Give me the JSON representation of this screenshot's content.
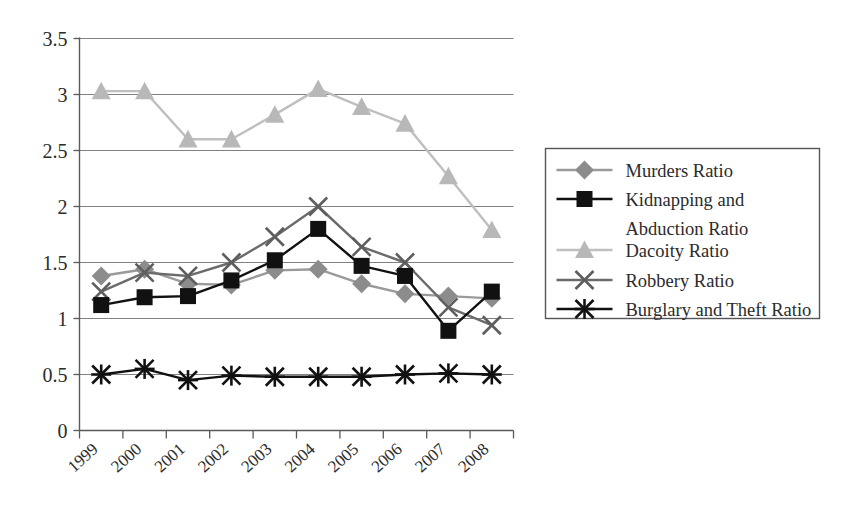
{
  "chart_data": {
    "type": "line",
    "title": "",
    "subtitle": "",
    "xlabel": "",
    "ylabel": "",
    "categories": [
      "1999",
      "2000",
      "2001",
      "2002",
      "2003",
      "2004",
      "2005",
      "2006",
      "2007",
      "2008"
    ],
    "ylim": [
      0,
      3.5
    ],
    "yticks": [
      "0",
      "0.5",
      "1",
      "1.5",
      "2",
      "2.5",
      "3",
      "3.5"
    ],
    "ytick_values": [
      0,
      0.5,
      1,
      1.5,
      2,
      2.5,
      3,
      3.5
    ],
    "grid": true,
    "grid_axis": "y",
    "legend_position": "right",
    "series": [
      {
        "name": "Murders Ratio",
        "marker": "diamond",
        "color": "#8c8c8c",
        "line_color": "#9a9a9a",
        "values": [
          1.38,
          1.44,
          1.31,
          1.3,
          1.43,
          1.44,
          1.31,
          1.22,
          1.2,
          1.18
        ]
      },
      {
        "name": "Kidnapping and Abduction Ratio",
        "marker": "square",
        "color": "#111111",
        "line_color": "#111111",
        "values": [
          1.12,
          1.19,
          1.2,
          1.34,
          1.52,
          1.8,
          1.47,
          1.38,
          0.89,
          1.24
        ]
      },
      {
        "name": "Dacoity Ratio",
        "marker": "triangle",
        "color": "#b8b8b8",
        "line_color": "#bfbfbf",
        "values": [
          3.03,
          3.03,
          2.6,
          2.6,
          2.82,
          3.05,
          2.89,
          2.74,
          2.27,
          1.79
        ]
      },
      {
        "name": "Robbery Ratio",
        "marker": "x",
        "color": "#5e5e5e",
        "line_color": "#6b6b6b",
        "values": [
          1.24,
          1.41,
          1.38,
          1.5,
          1.73,
          2.0,
          1.64,
          1.5,
          1.1,
          0.94
        ]
      },
      {
        "name": "Burglary and Theft Ratio",
        "marker": "asterisk",
        "color": "#111111",
        "line_color": "#111111",
        "values": [
          0.5,
          0.55,
          0.45,
          0.49,
          0.48,
          0.48,
          0.48,
          0.5,
          0.51,
          0.5
        ]
      }
    ]
  },
  "legend": {
    "items": [
      {
        "label": "Murders Ratio",
        "label2": ""
      },
      {
        "label": "Kidnapping and",
        "label2": "Abduction Ratio"
      },
      {
        "label": "Dacoity Ratio",
        "label2": ""
      },
      {
        "label": "Robbery Ratio",
        "label2": ""
      },
      {
        "label": "Burglary and Theft Ratio",
        "label2": ""
      }
    ]
  },
  "axes": {
    "y_labels": [
      "3.5",
      "3",
      "2.5",
      "2",
      "1.5",
      "1",
      "0.5",
      "0"
    ],
    "x_labels": [
      "1999",
      "2000",
      "2001",
      "2002",
      "2003",
      "2004",
      "2005",
      "2006",
      "2007",
      "2008"
    ]
  }
}
